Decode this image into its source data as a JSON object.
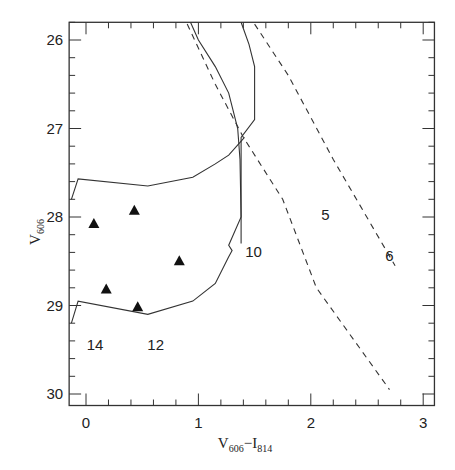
{
  "chart_data": {
    "type": "scatter",
    "title": "",
    "xlabel": "V606-I814",
    "xlabel_parts": {
      "main1": "V",
      "sub1": "606",
      "sep": "−",
      "main2": "I",
      "sub2": "814"
    },
    "ylabel": "V606",
    "ylabel_parts": {
      "main": "V",
      "sub": "606"
    },
    "xlim": [
      -0.15,
      3.1
    ],
    "ylim": [
      30.13,
      25.8
    ],
    "y_inverted": true,
    "grid": false,
    "x_ticks": [
      0,
      1,
      2,
      3
    ],
    "x_tick_labels": [
      "0",
      "1",
      "2",
      "3"
    ],
    "y_ticks": [
      26,
      27,
      28,
      29,
      30
    ],
    "y_tick_labels": [
      "26",
      "27",
      "28",
      "29",
      "30"
    ],
    "x_minor_step": 0.2,
    "y_minor_step": 0.2,
    "series": [
      {
        "name": "selection-region",
        "style": "solid",
        "points": [
          [
            -0.13,
            29.2
          ],
          [
            -0.07,
            28.95
          ],
          [
            0.55,
            29.1
          ],
          [
            0.95,
            28.95
          ],
          [
            1.15,
            28.75
          ],
          [
            1.27,
            28.45
          ],
          [
            1.3,
            28.38
          ],
          [
            1.27,
            28.32
          ],
          [
            1.38,
            28.0
          ],
          [
            1.38,
            27.1
          ],
          [
            1.5,
            26.9
          ],
          [
            1.5,
            26.3
          ],
          [
            1.45,
            26.05
          ],
          [
            1.38,
            25.8
          ]
        ]
      },
      {
        "name": "selection-region-upper",
        "style": "solid",
        "points": [
          [
            -0.13,
            27.8
          ],
          [
            -0.07,
            27.57
          ],
          [
            0.55,
            27.65
          ],
          [
            0.95,
            27.55
          ],
          [
            1.15,
            27.4
          ],
          [
            1.27,
            27.3
          ],
          [
            1.41,
            27.1
          ]
        ]
      },
      {
        "name": "track-solid",
        "style": "solid",
        "points": [
          [
            0.93,
            25.8
          ],
          [
            1.0,
            26.0
          ],
          [
            1.15,
            26.3
          ],
          [
            1.27,
            26.6
          ],
          [
            1.35,
            27.0
          ],
          [
            1.37,
            27.35
          ],
          [
            1.38,
            28.0
          ],
          [
            1.38,
            28.3
          ]
        ]
      },
      {
        "name": "track-dashed-inner",
        "style": "dashed",
        "points": [
          [
            0.9,
            25.82
          ],
          [
            1.15,
            26.5
          ],
          [
            1.4,
            27.1
          ],
          [
            1.75,
            27.8
          ],
          [
            2.05,
            28.8
          ],
          [
            2.7,
            29.95
          ]
        ]
      },
      {
        "name": "track-dashed-outer",
        "style": "dashed",
        "points": [
          [
            1.5,
            25.82
          ],
          [
            1.8,
            26.4
          ],
          [
            2.2,
            27.35
          ],
          [
            2.75,
            28.55
          ]
        ]
      },
      {
        "name": "objects",
        "style": "marker-triangle",
        "points": [
          [
            0.07,
            28.08
          ],
          [
            0.43,
            27.93
          ],
          [
            0.83,
            28.5
          ],
          [
            0.18,
            28.82
          ],
          [
            0.46,
            29.02
          ]
        ]
      }
    ],
    "annotations": [
      {
        "text": "5",
        "x": 2.13,
        "y": 28.03
      },
      {
        "text": "6",
        "x": 2.7,
        "y": 28.5
      },
      {
        "text": "10",
        "x": 1.49,
        "y": 28.45
      },
      {
        "text": "14",
        "x": 0.08,
        "y": 29.5
      },
      {
        "text": "12",
        "x": 0.62,
        "y": 29.5
      }
    ]
  },
  "caption": {
    "visible_fragment": "Figure"
  }
}
